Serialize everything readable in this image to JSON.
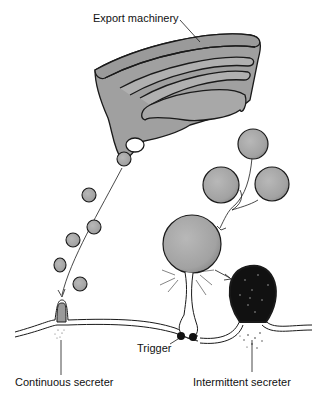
{
  "diagram": {
    "labels": {
      "export_machinery": "Export machinery",
      "trigger": "Trigger",
      "continuous_secreter": "Continuous secreter",
      "intermittent_secreter": "Intermittent secreter"
    },
    "colors": {
      "organelle_fill": "#a8a8a8",
      "outline": "#1a1a1a",
      "background": "#ffffff"
    }
  }
}
